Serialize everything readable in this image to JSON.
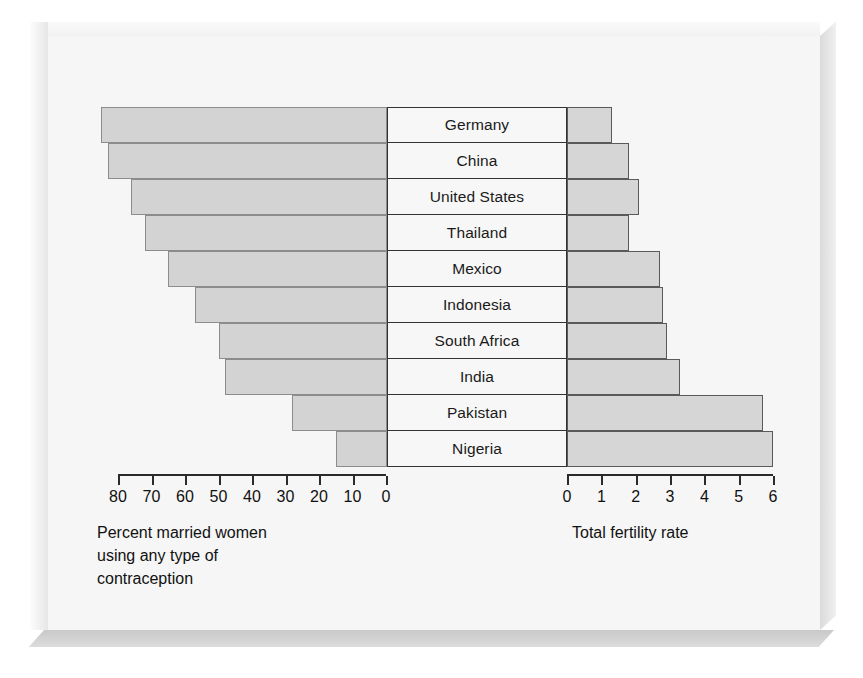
{
  "figure": {
    "left_caption": "Percent married women\nusing any type of\ncontraception",
    "left_caption_lines": [
      "Percent married women",
      "using any type of",
      "contraception"
    ],
    "right_caption": "Total fertility rate"
  },
  "colors": {
    "bar_fill": "#d3d3d3",
    "bar_stroke": "#8c8c8c",
    "axis": "#2b2b2b",
    "page": "#f6f6f6",
    "text": "#111111"
  },
  "chart_data": {
    "type": "bar",
    "title": "",
    "subtitle": "",
    "orientation": "horizontal",
    "layout": "back-to-back population-pyramid style; left panel bars extend leftward from a shared centre column of country labels, right panel bars extend rightward",
    "categories": [
      "Germany",
      "China",
      "United States",
      "Thailand",
      "Mexico",
      "Indonesia",
      "South Africa",
      "India",
      "Pakistan",
      "Nigeria"
    ],
    "series": [
      {
        "name": "Percent married women using any type of contraception",
        "side": "left",
        "unit": "percent",
        "axis_label": "Percent married women using any type of contraception",
        "axis_direction": "right-to-left",
        "ticks": [
          80,
          70,
          60,
          50,
          40,
          30,
          20,
          10,
          0
        ],
        "xlim": [
          80,
          0
        ],
        "values": [
          85,
          83,
          76,
          72,
          65,
          57,
          50,
          48,
          28,
          15
        ]
      },
      {
        "name": "Total fertility rate",
        "side": "right",
        "unit": "births per woman",
        "axis_label": "Total fertility rate",
        "axis_direction": "left-to-right",
        "ticks": [
          0,
          1,
          2,
          3,
          4,
          5,
          6
        ],
        "xlim": [
          0,
          6
        ],
        "values": [
          1.3,
          1.8,
          2.1,
          1.8,
          2.7,
          2.8,
          2.9,
          3.3,
          5.7,
          6.0
        ]
      }
    ],
    "grid": false,
    "legend": "none"
  }
}
